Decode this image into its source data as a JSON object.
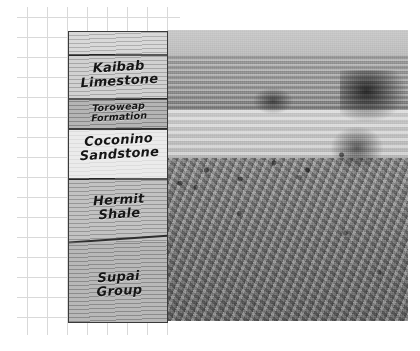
{
  "figure": {
    "background_color": "#ffffff"
  },
  "grid": {
    "name": "graph-paper-grid",
    "line_color": "#d9d9d9",
    "cell_size_px": 20
  },
  "photo": {
    "name": "grand-canyon-photograph",
    "description": "Grayscale photograph of Grand Canyon cliffs, talus slope and layered canyon walls",
    "tone": "grayscale"
  },
  "column": {
    "name": "stratigraphic-column",
    "border_color": "#3a3a3a",
    "layers": [
      {
        "id": "cap",
        "label": "",
        "color": "#cfcfcf",
        "label_size": "big"
      },
      {
        "id": "kaibab",
        "label": "Kaibab\nLimestone",
        "line1": "Kaibab",
        "line2": "Limestone",
        "color": "#c6c6c6",
        "label_size": "big"
      },
      {
        "id": "toroweap",
        "label": "Toroweap\nFormation",
        "line1": "Toroweap",
        "line2": "Formation",
        "color": "#a2a2a2",
        "label_size": "small"
      },
      {
        "id": "coconino",
        "label": "Coconino\nSandstone",
        "line1": "Coconino",
        "line2": "Sandstone",
        "color": "#eaeaea",
        "label_size": "big"
      },
      {
        "id": "hermit",
        "label": "Hermit\nShale",
        "line1": "Hermit",
        "line2": "Shale",
        "color": "#b3b3b3",
        "label_size": "big"
      },
      {
        "id": "supai",
        "label": "Supai\nGroup",
        "line1": "Supai",
        "line2": "Group",
        "color": "#a6a6a6",
        "label_size": "big"
      }
    ]
  }
}
